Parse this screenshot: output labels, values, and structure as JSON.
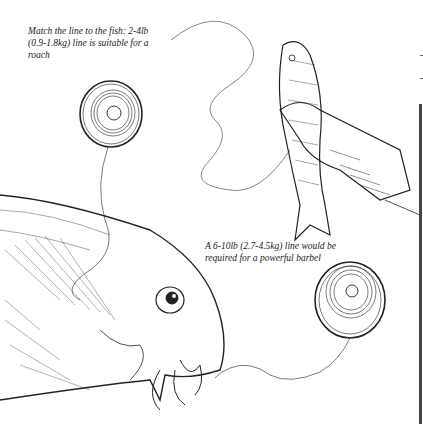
{
  "illustration": {
    "title": "Matching fishing line to fish",
    "captions": [
      "Match the line to the fish: 2-4lb (0.9-1.8kg) line is suitable for a roach",
      "A 6-10lb (2.7-4.5kg) line would be required for a powerful barbel"
    ],
    "elements": [
      "line-spool-small",
      "roach-in-hand",
      "barbel-head",
      "line-spool-large"
    ]
  }
}
